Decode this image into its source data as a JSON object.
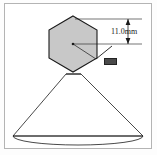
{
  "figure": {
    "background_color": "#ffffff",
    "frame_color": "#b4b4b4",
    "line_color": "#1a1a1a",
    "hex_fill_color": "#c8c8c8"
  },
  "annotations": {
    "dimension_label": "11.0mm",
    "reference_label": "",
    "dimension_value": 11.0,
    "dimension_unit": "mm"
  },
  "geometry": {
    "hexagon": {
      "center_x": 73,
      "center_y": 44,
      "circumradius": 28,
      "points": "73,16 97,30 97,58 73,72 49,58 49,30"
    },
    "cone": {
      "apex_left_x": 66,
      "apex_right_x": 81,
      "apex_y": 74,
      "base_left_x": 13,
      "base_right_x": 143,
      "base_y": 136
    },
    "base_ellipse": {
      "center_x": 78,
      "center_y": 136,
      "rx": 65,
      "ry": 8
    },
    "dimension_line": {
      "top_y": 19,
      "bottom_y": 44,
      "arrow_x": 128,
      "extension_left_x": 75,
      "extension_right_x": 142
    },
    "leader": {
      "x1": 95,
      "y1": 58,
      "x2": 112,
      "y2": 46
    }
  }
}
